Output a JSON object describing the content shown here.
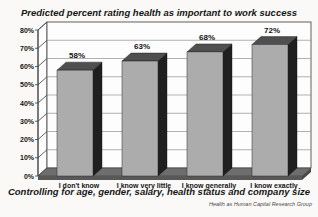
{
  "header": {
    "title": "Predicted percent rating health as important to work success"
  },
  "footer": {
    "caption": "Controlling for age, gender, salary, health status and company size",
    "credit": "Health as Human Capital Research Group"
  },
  "chart_data": {
    "type": "bar",
    "style": "3d-column",
    "title": "Predicted percent rating health as important to work success",
    "xlabel": "Controlling for age, gender, salary, health status and company size",
    "ylabel": "",
    "categories": [
      "I don't know",
      "I know very little",
      "I know generally",
      "I know exactly"
    ],
    "values": [
      58,
      63,
      68,
      72
    ],
    "value_labels": [
      "58%",
      "63%",
      "68%",
      "72%"
    ],
    "y_ticks": [
      "0%",
      "10%",
      "20%",
      "30%",
      "40%",
      "50%",
      "60%",
      "70%",
      "80%"
    ],
    "ylim": [
      0,
      80
    ],
    "grid": true,
    "legend": false,
    "colors": {
      "bar_front": "#acacac",
      "bar_top": "#4f4f4f",
      "bar_side": "#1f1f1f",
      "floor_top": "#6e6e6e",
      "floor_front": "#585858",
      "floor_side": "#474747",
      "wall": "#fdfdfd",
      "gridline": "#8f8f8f",
      "frame": "#3a3a3a",
      "text": "#141414"
    }
  }
}
